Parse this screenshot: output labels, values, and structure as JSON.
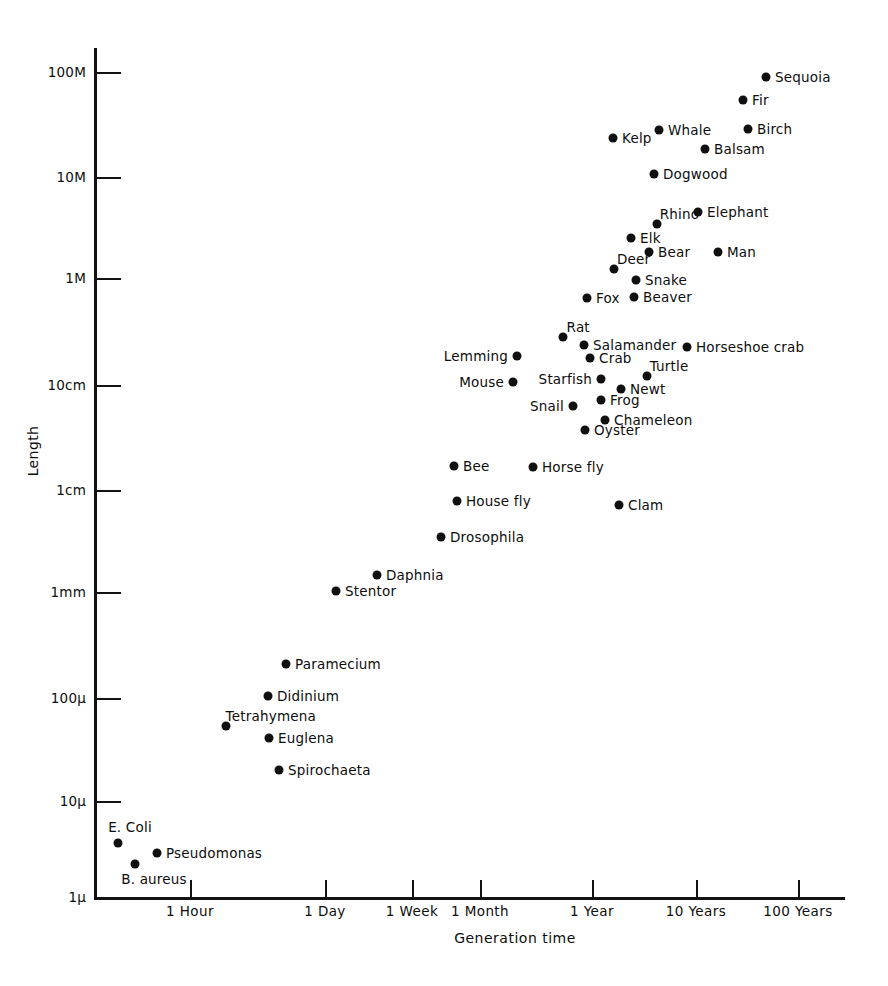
{
  "chart_data": {
    "type": "scatter",
    "title": "",
    "xlabel": "Generation time",
    "ylabel": "Length",
    "grid": false,
    "legend": "none",
    "x_scale": "log",
    "y_scale": "log",
    "x_ticks": [
      "1 Hour",
      "1 Day",
      "1 Week",
      "1 Month",
      "1 Year",
      "10 Years",
      "100 Years"
    ],
    "y_ticks": [
      "100M",
      "10M",
      "1M",
      "10cm",
      "1cm",
      "1mm",
      "100μ",
      "10μ",
      "1μ"
    ],
    "points": [
      {
        "label": "Sequoia",
        "x": "~40 Years",
        "y": "~70M",
        "px": 766,
        "py": 77,
        "pos": "right"
      },
      {
        "label": "Fir",
        "x": "~25 Years",
        "y": "~40M",
        "px": 743,
        "py": 100,
        "pos": "right"
      },
      {
        "label": "Whale",
        "x": "~4 Years",
        "y": "~22M",
        "px": 659,
        "py": 130,
        "pos": "right"
      },
      {
        "label": "Birch",
        "x": "~30 Years",
        "y": "~22M",
        "px": 748,
        "py": 129,
        "pos": "right"
      },
      {
        "label": "Kelp",
        "x": "~1.5 Years",
        "y": "~20M",
        "px": 613,
        "py": 138,
        "pos": "right"
      },
      {
        "label": "Balsam",
        "x": "~12 Years",
        "y": "~16M",
        "px": 705,
        "py": 149,
        "pos": "right"
      },
      {
        "label": "Dogwood",
        "x": "~3.5 Years",
        "y": "~10M",
        "px": 654,
        "py": 174,
        "pos": "right"
      },
      {
        "label": "Elephant",
        "x": "~10 Years",
        "y": "~5M",
        "px": 698,
        "py": 212,
        "pos": "right"
      },
      {
        "label": "Rhino",
        "x": "~4 Years",
        "y": "~3.5M",
        "px": 657,
        "py": 224,
        "pos": "aboveright"
      },
      {
        "label": "Elk",
        "x": "~2.5 Years",
        "y": "~2.5M",
        "px": 631,
        "py": 238,
        "pos": "right"
      },
      {
        "label": "Bear",
        "x": "~3.5 Years",
        "y": "~2M",
        "px": 649,
        "py": 252,
        "pos": "right"
      },
      {
        "label": "Man",
        "x": "~12 Years",
        "y": "~2M",
        "px": 718,
        "py": 252,
        "pos": "right"
      },
      {
        "label": "Deer",
        "x": "~2 Years",
        "y": "~1.2M",
        "px": 614,
        "py": 269,
        "pos": "aboveright"
      },
      {
        "label": "Snake",
        "x": "~3 Years",
        "y": "~1M",
        "px": 636,
        "py": 280,
        "pos": "right"
      },
      {
        "label": "Fox",
        "x": "~1.3 Years",
        "y": "~700K",
        "px": 587,
        "py": 298,
        "pos": "right"
      },
      {
        "label": "Beaver",
        "x": "~3 Years",
        "y": "~700K",
        "px": 634,
        "py": 297,
        "pos": "right"
      },
      {
        "label": "Rat",
        "x": "~1 Year",
        "y": "~30cm",
        "px": 563,
        "py": 337,
        "pos": "aboveright"
      },
      {
        "label": "Salamander",
        "x": "~1.3 Years",
        "y": "~25cm",
        "px": 584,
        "py": 345,
        "pos": "right"
      },
      {
        "label": "Horseshoe crab",
        "x": "~10 Years",
        "y": "~25cm",
        "px": 687,
        "py": 347,
        "pos": "right"
      },
      {
        "label": "Lemming",
        "x": "~8 Months",
        "y": "~20cm",
        "px": 517,
        "py": 356,
        "pos": "left"
      },
      {
        "label": "Crab",
        "x": "~1.5 Years",
        "y": "~20cm",
        "px": 590,
        "py": 358,
        "pos": "right"
      },
      {
        "label": "Turtle",
        "x": "~4 Years",
        "y": "~13cm",
        "px": 647,
        "py": 376,
        "pos": "aboveright"
      },
      {
        "label": "Starfish",
        "x": "~1.4 Years",
        "y": "~12cm",
        "px": 601,
        "py": 379,
        "pos": "left"
      },
      {
        "label": "Mouse",
        "x": "~7 Months",
        "y": "~10cm",
        "px": 513,
        "py": 382,
        "pos": "left"
      },
      {
        "label": "Newt",
        "x": "~2 Years",
        "y": "~9cm",
        "px": 621,
        "py": 389,
        "pos": "right"
      },
      {
        "label": "Frog",
        "x": "~1.4 Years",
        "y": "~7cm",
        "px": 601,
        "py": 400,
        "pos": "right"
      },
      {
        "label": "Snail",
        "x": "~1 Year",
        "y": "~6cm",
        "px": 573,
        "py": 406,
        "pos": "left"
      },
      {
        "label": "Chameleon",
        "x": "~1.5 Years",
        "y": "~5cm",
        "px": 605,
        "py": 420,
        "pos": "right"
      },
      {
        "label": "Oyster",
        "x": "~1.2 Years",
        "y": "~4cm",
        "px": 585,
        "py": 430,
        "pos": "right"
      },
      {
        "label": "Bee",
        "x": "~2 Months",
        "y": "~1.7cm",
        "px": 454,
        "py": 466,
        "pos": "right"
      },
      {
        "label": "Horse fly",
        "x": "~9 Months",
        "y": "~1.7cm",
        "px": 533,
        "py": 467,
        "pos": "right"
      },
      {
        "label": "House fly",
        "x": "~2 Months",
        "y": "~1cm",
        "px": 457,
        "py": 501,
        "pos": "right"
      },
      {
        "label": "Clam",
        "x": "~2 Years",
        "y": "~0.9cm",
        "px": 619,
        "py": 505,
        "pos": "right"
      },
      {
        "label": "Drosophila",
        "x": "~3 Weeks",
        "y": "~4mm",
        "px": 441,
        "py": 537,
        "pos": "right"
      },
      {
        "label": "Daphnia",
        "x": "~5 Days",
        "y": "~1.4mm",
        "px": 377,
        "py": 575,
        "pos": "right"
      },
      {
        "label": "Stentor",
        "x": "~2.5 Days",
        "y": "~1mm",
        "px": 336,
        "py": 591,
        "pos": "right"
      },
      {
        "label": "Paramecium",
        "x": "~20 Hours",
        "y": "~200μ",
        "px": 286,
        "py": 664,
        "pos": "right"
      },
      {
        "label": "Didinium",
        "x": "~14 Hours",
        "y": "~100μ",
        "px": 268,
        "py": 696,
        "pos": "right"
      },
      {
        "label": "Tetrahymena",
        "x": "~7 Hours",
        "y": "~50μ",
        "px": 226,
        "py": 726,
        "pos": "aboveright"
      },
      {
        "label": "Euglena",
        "x": "~14 Hours",
        "y": "~40μ",
        "px": 269,
        "py": 738,
        "pos": "right"
      },
      {
        "label": "Spirochaeta",
        "x": "~16 Hours",
        "y": "~20μ",
        "px": 279,
        "py": 770,
        "pos": "right"
      },
      {
        "label": "E. Coli",
        "x": "~30 Minutes",
        "y": "~4μ",
        "px": 118,
        "py": 843,
        "pos": "above"
      },
      {
        "label": "Pseudomonas",
        "x": "~50 Minutes",
        "y": "~2.8μ",
        "px": 157,
        "py": 853,
        "pos": "right"
      },
      {
        "label": "B. aureus",
        "x": "~40 Minutes",
        "y": "~2μ",
        "px": 135,
        "py": 864,
        "pos": "below"
      }
    ]
  },
  "axes": {
    "y_title": "Length",
    "x_title": "Generation time",
    "y_ticks": [
      {
        "label": "100M",
        "py": 72
      },
      {
        "label": "10M",
        "py": 177
      },
      {
        "label": "1M",
        "py": 278
      },
      {
        "label": "10cm",
        "py": 385
      },
      {
        "label": "1cm",
        "py": 490
      },
      {
        "label": "1mm",
        "py": 592
      },
      {
        "label": "100μ",
        "py": 698
      },
      {
        "label": "10μ",
        "py": 801
      },
      {
        "label": "1μ",
        "py": 897
      }
    ],
    "x_ticks": [
      {
        "label": "1 Hour",
        "px": 190
      },
      {
        "label": "1 Day",
        "px": 325
      },
      {
        "label": "1 Week",
        "px": 412
      },
      {
        "label": "1 Month",
        "px": 480
      },
      {
        "label": "1 Year",
        "px": 592
      },
      {
        "label": "10 Years",
        "px": 696
      },
      {
        "label": "100 Years",
        "px": 798
      }
    ]
  },
  "colors": {
    "ink": "#101010",
    "background": "#ffffff"
  }
}
